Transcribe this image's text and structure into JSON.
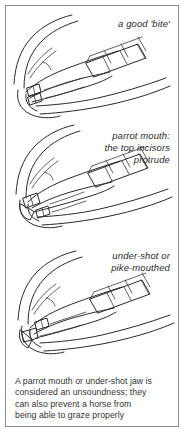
{
  "figure": {
    "kind": "line-drawing-figure",
    "background_color": "#ffffff",
    "border_color": "#8d8d8d",
    "ink_color": "#2a2a2a",
    "text_color": "#333333"
  },
  "panels": [
    {
      "id": "good-bite",
      "label_lines": [
        "a good 'bite'"
      ],
      "subject": "horse head in profile with correctly aligned incisors and molar row"
    },
    {
      "id": "parrot-mouth",
      "label_lines": [
        "parrot mouth:",
        "the top incisors",
        "protrude"
      ],
      "subject": "horse head in profile where the upper incisors overhang the lower incisors"
    },
    {
      "id": "under-shot",
      "label_lines": [
        "under-shot or",
        "pike-mouthed"
      ],
      "subject": "horse head in profile where the lower jaw projects beyond the upper incisors"
    }
  ],
  "caption": {
    "lines": [
      "A parrot mouth or under-shot jaw is",
      "considered an unsoundness; they",
      "can also prevent a horse from",
      "being able to graze properly"
    ]
  }
}
